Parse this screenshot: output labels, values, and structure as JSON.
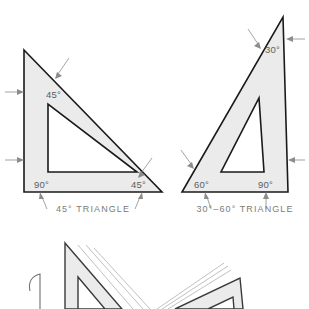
{
  "figure": {
    "background_color": "#ffffff",
    "face_fill_color": "#ebebeb",
    "edge_color": "#1a1a1a",
    "label_color": "#5d5d5d",
    "caption_color": "#7b7b7b",
    "leader_color": "#8c8c8c",
    "ghost_color": "#b9b9b9"
  },
  "triangles": [
    {
      "id": "forty-five-triangle",
      "caption": "45° TRIANGLE",
      "angles": [
        {
          "name": "apex-angle",
          "value": "45°",
          "x": 46,
          "y": 98
        },
        {
          "name": "right-angle",
          "value": "90°",
          "x": 34,
          "y": 188
        },
        {
          "name": "base-right-angle",
          "value": "45°",
          "x": 131,
          "y": 188
        }
      ],
      "caption_x": 93,
      "caption_y": 212
    },
    {
      "id": "thirty-sixty-triangle",
      "caption": "30°–60° TRIANGLE",
      "angles": [
        {
          "name": "apex-angle",
          "value": "30°",
          "x": 265,
          "y": 53
        },
        {
          "name": "base-left-angle",
          "value": "60°",
          "x": 194,
          "y": 188
        },
        {
          "name": "right-angle",
          "value": "90°",
          "x": 258,
          "y": 188
        }
      ],
      "caption_x": 245,
      "caption_y": 212
    }
  ],
  "lower_figures": [
    {
      "id": "lower-left-triangle-stack",
      "description": "partially cropped 45 degree triangle with motion guide lines"
    },
    {
      "id": "lower-right-triangle-stack",
      "description": "partially cropped triangle with motion guide lines"
    },
    {
      "id": "lower-left-arc",
      "description": "cropped curved arc outline"
    }
  ]
}
